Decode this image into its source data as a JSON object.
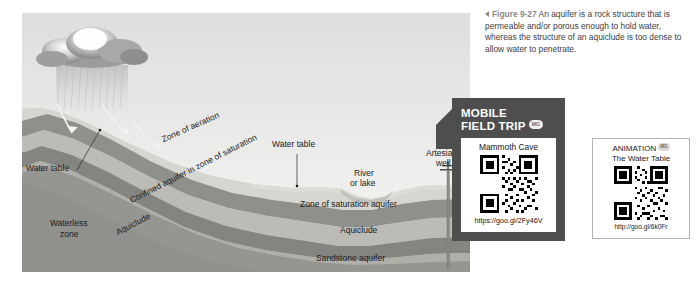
{
  "figure": {
    "marker_icon": "left-triangle-icon",
    "number": "Figure 9-27",
    "caption": "An aquifer is a rock structure that is permeable and/or porous enough to hold water, whereas the structure of an aquiclude is too dense to allow water to penetrate."
  },
  "diagram": {
    "name": "aquifer-cross-section-diagram",
    "sky_color": "#e7e7e5",
    "cloud": {
      "icon": "rain-cloud-icon",
      "rain": "rain-streaks"
    },
    "infiltration_arrows": 3,
    "labels": [
      {
        "id": "water-table-left",
        "text": "Water table"
      },
      {
        "id": "zone-of-aeration",
        "text": "Zone of aeration"
      },
      {
        "id": "water-table-center",
        "text": "Water table"
      },
      {
        "id": "river-or-lake",
        "text": "River\nor lake"
      },
      {
        "id": "river-or-lake-line1",
        "text": "River"
      },
      {
        "id": "river-or-lake-line2",
        "text": "or lake"
      },
      {
        "id": "artesian-well-line1",
        "text": "Artesian"
      },
      {
        "id": "artesian-well-line2",
        "text": "well"
      },
      {
        "id": "confined-aquifer",
        "text": "Confined aquifer in zone of saturation"
      },
      {
        "id": "aquiclude-left",
        "text": "Aquiclude"
      },
      {
        "id": "waterless-zone-line1",
        "text": "Waterless"
      },
      {
        "id": "waterless-zone-line2",
        "text": "zone"
      },
      {
        "id": "zone-of-saturation-aquifer",
        "text": "Zone of saturation aquifer"
      },
      {
        "id": "aquiclude-right",
        "text": "Aquiclude"
      },
      {
        "id": "sandstone-aquifer",
        "text": "Sandstone aquifer"
      }
    ],
    "strata_colors": [
      "#d6d4cf",
      "#9a9a96",
      "#c2c0ba",
      "#8c8c88",
      "#b3b1ab",
      "#6f6f6c"
    ]
  },
  "mobile_field_trip": {
    "title_line1": "MOBILE",
    "title_line2": "FIELD TRIP",
    "badge": "MG",
    "card_title": "Mammoth Cave",
    "qr_alt": "qr-code",
    "url": "https://goo.gl/2Fy46V",
    "panel_color": "#4e4e4e"
  },
  "animation": {
    "title": "ANIMATION",
    "badge": "MG",
    "subtitle": "The Water Table",
    "qr_alt": "qr-code",
    "url": "http://goo.gl/6k0Fr"
  }
}
